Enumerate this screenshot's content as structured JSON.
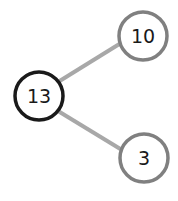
{
  "diagram": {
    "type": "number-bond",
    "whole": {
      "value": "13",
      "stroke": "#1a1a1a"
    },
    "parts": [
      {
        "value": "10",
        "stroke": "#808080"
      },
      {
        "value": "3",
        "stroke": "#808080"
      }
    ],
    "connector_color": "#a8a8a8"
  }
}
